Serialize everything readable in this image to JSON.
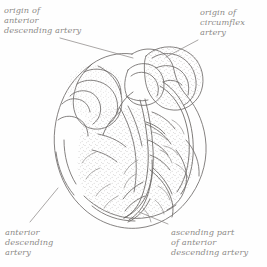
{
  "figure": {
    "type": "anatomical-line-drawing",
    "style": "pen-and-ink stipple illustration",
    "ink_color": "#6f6c6a",
    "stipple_color": "#8a8785",
    "leader_color": "#8d8a88",
    "background_color": "#fefefe",
    "text_color": "#8d8a88"
  },
  "labels": {
    "origin_anterior_descending": "origin of\nanterior\ndescending artery",
    "origin_circumflex": "origin of\ncircumflex\nartery",
    "anterior_descending": "anterior\ndescending\nartery",
    "ascending_part": "ascending part\nof anterior\ndescending artery"
  },
  "leaders": [
    {
      "name": "leader-origin-anterior-descending",
      "from": [
        60,
        38
      ],
      "to": [
        133,
        58
      ]
    },
    {
      "name": "leader-origin-circumflex",
      "from": [
        198,
        40
      ],
      "to": [
        166,
        57
      ]
    },
    {
      "name": "leader-anterior-descending",
      "from": [
        30,
        222
      ],
      "to": [
        58,
        188
      ]
    },
    {
      "name": "leader-ascending-part",
      "from": [
        168,
        224
      ],
      "to": [
        139,
        212
      ]
    }
  ]
}
